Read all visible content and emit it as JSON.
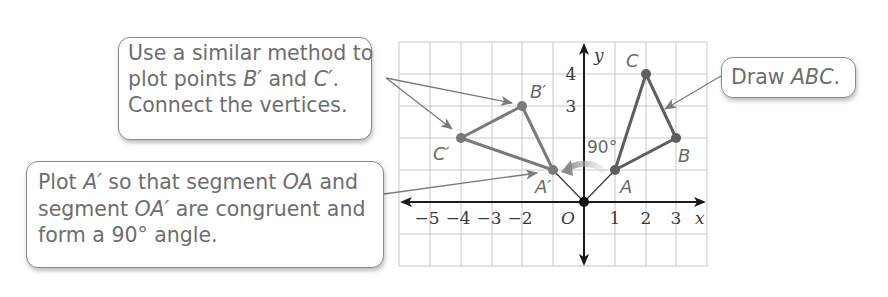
{
  "callouts": {
    "similar_method": {
      "lines": [
        "Use a similar method to",
        "plot points ",
        "Connect the vertices."
      ],
      "b_prime": "B′",
      "and": " and ",
      "c_prime": "C′",
      "period": "."
    },
    "plot_a_prime": {
      "line1_pre": "Plot ",
      "line1_a": "A′",
      "line1_mid": " so that segment ",
      "line1_oa": "OA",
      "line1_post": " and",
      "line2_pre": "segment ",
      "line2_oa": "OA′",
      "line2_post": " are congruent and",
      "line3": "form a 90° angle."
    },
    "draw_abc": {
      "pre": "Draw ",
      "abc": "ABC",
      "post": "."
    }
  },
  "graph": {
    "x_axis_label": "x",
    "y_axis_label": "y",
    "origin_label": "O",
    "x_tick_labels": [
      "−5",
      "−4",
      "−3",
      "−2",
      "1",
      "2",
      "3"
    ],
    "y_tick_labels": [
      "4",
      "3"
    ],
    "angle_label": "90°",
    "grid_range": {
      "x": [
        -6,
        4
      ],
      "y": [
        -2,
        5
      ]
    },
    "colors": {
      "grid": "#c8c8c8",
      "axis": "#1a1a1a",
      "triangle": "#6b6b6b",
      "arrow": "#7a7a7a",
      "text": "#6a6a6a"
    },
    "triangle_abc": {
      "A": {
        "label": "A",
        "x": 1,
        "y": 1
      },
      "B": {
        "label": "B",
        "x": 3,
        "y": 2
      },
      "C": {
        "label": "C",
        "x": 2,
        "y": 4
      }
    },
    "triangle_abc_prime": {
      "A": {
        "label": "A′",
        "x": -1,
        "y": 1
      },
      "B": {
        "label": "B′",
        "x": -2,
        "y": 3
      },
      "C": {
        "label": "C′",
        "x": -4,
        "y": 2
      }
    },
    "rotation": {
      "angle_deg": 90,
      "direction": "counterclockwise",
      "center": "O"
    }
  }
}
